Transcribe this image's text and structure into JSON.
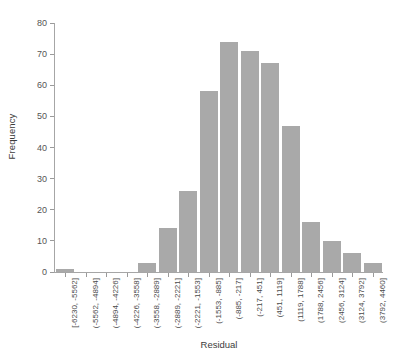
{
  "chart_data": {
    "type": "bar",
    "title": "",
    "xlabel": "Residual",
    "ylabel": "Frequency",
    "ylim": [
      0,
      80
    ],
    "yticks": [
      0,
      10,
      20,
      30,
      40,
      50,
      60,
      70,
      80
    ],
    "grid": false,
    "legend": null,
    "bar_color": "#a9a9a9",
    "categories": [
      "[-6230, -5562]",
      "(-5562, -4894]",
      "(-4894, -4226]",
      "(-4226, -3558]",
      "(-3558, -2889]",
      "(-2889, -2221]",
      "(-2221, -1553]",
      "(-1553, -885]",
      "(-885, -217]",
      "(-217, 451]",
      "(451, 1119]",
      "(1119, 1788]",
      "(1788, 2456]",
      "(2456, 3124]",
      "(3124, 3792]",
      "(3792, 4460]"
    ],
    "values": [
      1,
      0,
      0,
      0,
      3,
      14,
      26,
      58,
      74,
      71,
      67,
      47,
      16,
      10,
      6,
      3
    ]
  },
  "axes": {
    "y_title": "Frequency",
    "x_title": "Residual"
  }
}
